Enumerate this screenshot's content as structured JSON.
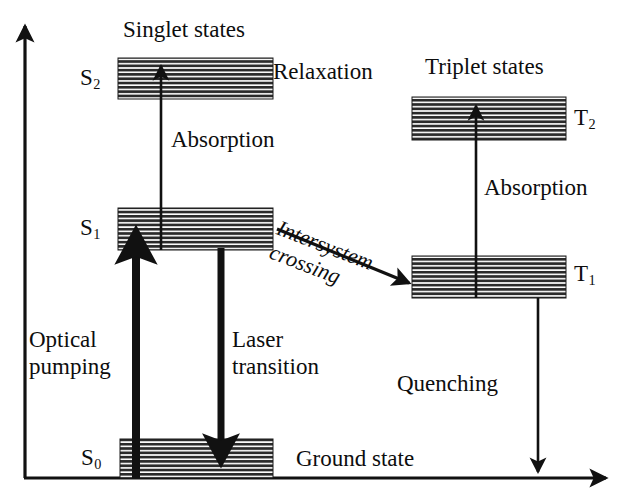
{
  "figure": {
    "kind": "energy-level-diagram",
    "ink_color": "#111111",
    "background_color": "#ffffff"
  },
  "axes": {
    "vertical_axis_name": "energy-axis",
    "horizontal_axis_name": "baseline-axis"
  },
  "group_titles": {
    "singlet": "Singlet states",
    "triplet": "Triplet states"
  },
  "levels": [
    {
      "id": "S2",
      "label_main": "S",
      "label_sub": "2",
      "group": "singlet",
      "label_side": "left"
    },
    {
      "id": "S1",
      "label_main": "S",
      "label_sub": "1",
      "group": "singlet",
      "label_side": "left"
    },
    {
      "id": "S0",
      "label_main": "S",
      "label_sub": "0",
      "group": "singlet",
      "label_side": "left",
      "name": "Ground state"
    },
    {
      "id": "T2",
      "label_main": "T",
      "label_sub": "2",
      "group": "triplet",
      "label_side": "right"
    },
    {
      "id": "T1",
      "label_main": "T",
      "label_sub": "1",
      "group": "triplet",
      "label_side": "right"
    }
  ],
  "level_labels": {
    "s2": "S",
    "s2_sub": "2",
    "s1": "S",
    "s1_sub": "1",
    "s0": "S",
    "s0_sub": "0",
    "t2": "T",
    "t2_sub": "2",
    "t1": "T",
    "t1_sub": "1",
    "ground_state": "Ground state"
  },
  "transitions": [
    {
      "id": "absorption-singlet",
      "label": "Absorption",
      "from": "S1",
      "to": "S2",
      "direction": "up",
      "weight": "thin"
    },
    {
      "id": "relaxation",
      "label": "Relaxation",
      "from": "S2",
      "to": "S2",
      "direction": "none",
      "weight": "none"
    },
    {
      "id": "optical-pumping",
      "label": "Optical pumping",
      "line1": "Optical",
      "line2": "pumping",
      "from": "S0",
      "to": "S1",
      "direction": "up",
      "weight": "thick"
    },
    {
      "id": "laser-transition",
      "label": "Laser transition",
      "line1": "Laser",
      "line2": "transition",
      "from": "S1",
      "to": "S0",
      "direction": "down",
      "weight": "thick"
    },
    {
      "id": "intersystem-crossing",
      "label": "Intersystem crossing",
      "line1": "Intersystem",
      "line2": "crossing",
      "from": "S1",
      "to": "T1",
      "direction": "diagonal-down-right",
      "weight": "medium"
    },
    {
      "id": "absorption-triplet",
      "label": "Absorption",
      "from": "T1",
      "to": "T2",
      "direction": "up",
      "weight": "thin"
    },
    {
      "id": "quenching",
      "label": "Quenching",
      "from": "T1",
      "to": "baseline",
      "direction": "down",
      "weight": "thin"
    }
  ],
  "transition_labels": {
    "relaxation": "Relaxation",
    "absorption_singlet": "Absorption",
    "absorption_triplet": "Absorption",
    "optical_pumping_l1": "Optical",
    "optical_pumping_l2": "pumping",
    "laser_transition_l1": "Laser",
    "laser_transition_l2": "transition",
    "intersystem_l1": "Intersystem",
    "intersystem_l2": "crossing",
    "quenching": "Quenching"
  }
}
